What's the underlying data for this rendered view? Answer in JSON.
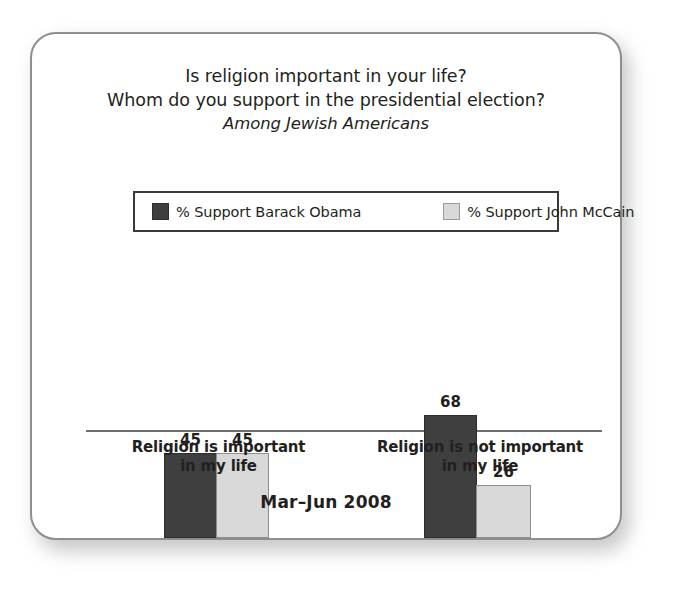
{
  "chart_data": {
    "type": "bar",
    "title": "Is religion important in your life?\nWhom do you support in the presidential election?",
    "title_lines": [
      "Is religion important in your life?",
      "Whom do you support in the presidential election?"
    ],
    "subtitle": "Among Jewish Americans",
    "xlabel": "",
    "ylabel": "",
    "ylim": [
      0,
      100
    ],
    "grid": false,
    "legend_position": "top-center",
    "period": "Mar–Jun 2008",
    "categories": [
      "Religion is important in my life",
      "Religion is not important in my life"
    ],
    "category_lines": [
      [
        "Religion is important",
        "in my life"
      ],
      [
        "Religion is not important",
        "in my life"
      ]
    ],
    "series": [
      {
        "name": "% Support Barack Obama",
        "color": "#3f3f3f",
        "values": [
          45,
          68
        ]
      },
      {
        "name": "% Support John McCain",
        "color": "#d9d9d9",
        "values": [
          45,
          26
        ]
      }
    ]
  },
  "legend": {
    "items": [
      {
        "label": "% Support Barack Obama",
        "swatch": "dark-swatch"
      },
      {
        "label": "% Support John McCain",
        "swatch": "light-swatch"
      }
    ]
  },
  "colors": {
    "obama": "#3f3f3f",
    "mccain": "#d9d9d9",
    "text": "#231f20",
    "card_border": "#8e8e8e",
    "axis": "#6e6e6e"
  }
}
